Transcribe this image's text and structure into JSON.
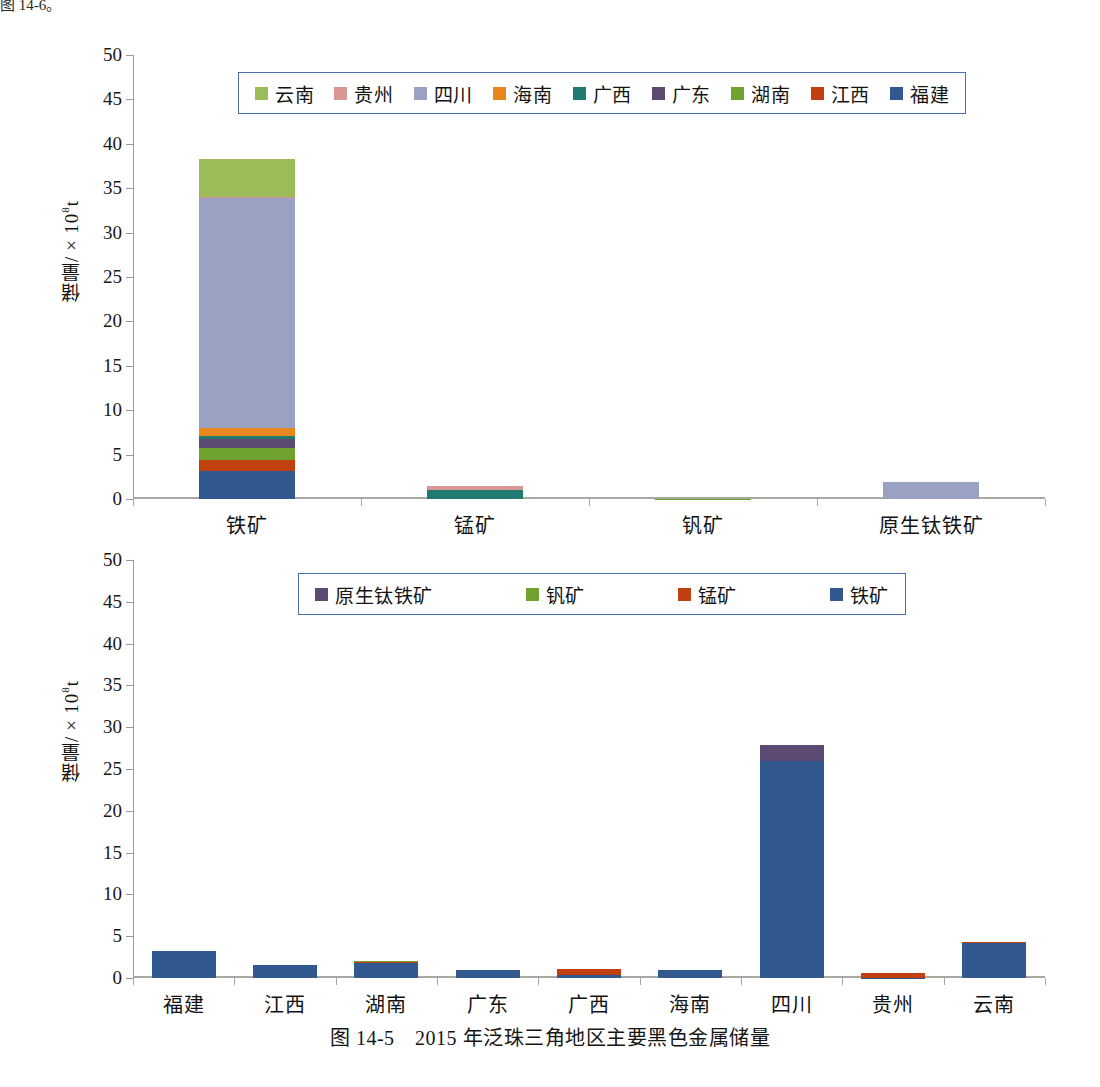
{
  "page": {
    "top_fragment": "图 14-6。",
    "caption": "图 14-5　2015 年泛珠三角地区主要黑色金属储量"
  },
  "colors": {
    "yunnan": "#9cbb59",
    "guizhou": "#d99694",
    "sichuan": "#9aa2c4",
    "hainan": "#e8871e",
    "guangxi": "#1f7a72",
    "guangdong": "#5c4a72",
    "hunan": "#6fa22e",
    "jiangxi": "#c0400f",
    "fujian": "#31588f",
    "tiekuang": "#31588f",
    "mengkuang": "#c0400f",
    "fankuang": "#6fa22e",
    "yuanshengtaitiekuang": "#5c4a72",
    "legend_border": "#4a6fb5",
    "axis": "#9a9a96"
  },
  "chart_data": [
    {
      "id": "chart-top",
      "type": "bar",
      "stacked": true,
      "title": "",
      "xlabel": "",
      "ylabel": "储量/×10⁸t",
      "ylim": [
        0,
        50
      ],
      "yticks": [
        0,
        5,
        10,
        15,
        20,
        25,
        30,
        35,
        40,
        45,
        50
      ],
      "grid": false,
      "legend_position": "top-center",
      "categories": [
        "铁矿",
        "锰矿",
        "钒矿",
        "原生钛铁矿"
      ],
      "series": [
        {
          "name": "福建",
          "color_key": "fujian",
          "values": [
            3.2,
            0.0,
            0.0,
            0.0
          ]
        },
        {
          "name": "江西",
          "color_key": "jiangxi",
          "values": [
            1.2,
            0.0,
            0.0,
            0.0
          ]
        },
        {
          "name": "湖南",
          "color_key": "hunan",
          "values": [
            1.4,
            0.0,
            0.05,
            0.0
          ]
        },
        {
          "name": "广东",
          "color_key": "guangdong",
          "values": [
            1.0,
            0.0,
            0.0,
            0.0
          ]
        },
        {
          "name": "广西",
          "color_key": "guangxi",
          "values": [
            0.35,
            1.0,
            0.0,
            0.0
          ]
        },
        {
          "name": "海南",
          "color_key": "hainan",
          "values": [
            0.85,
            0.0,
            0.0,
            0.0
          ]
        },
        {
          "name": "四川",
          "color_key": "sichuan",
          "values": [
            26.0,
            0.0,
            0.0,
            1.9
          ]
        },
        {
          "name": "贵州",
          "color_key": "guizhou",
          "values": [
            0.05,
            0.5,
            0.0,
            0.0
          ]
        },
        {
          "name": "云南",
          "color_key": "yunnan",
          "values": [
            4.2,
            0.0,
            0.0,
            0.0
          ]
        }
      ],
      "legend": [
        {
          "label": "云南",
          "color_key": "yunnan"
        },
        {
          "label": "贵州",
          "color_key": "guizhou"
        },
        {
          "label": "四川",
          "color_key": "sichuan"
        },
        {
          "label": "海南",
          "color_key": "hainan"
        },
        {
          "label": "广西",
          "color_key": "guangxi"
        },
        {
          "label": "广东",
          "color_key": "guangdong"
        },
        {
          "label": "湖南",
          "color_key": "hunan"
        },
        {
          "label": "江西",
          "color_key": "jiangxi"
        },
        {
          "label": "福建",
          "color_key": "fujian"
        }
      ]
    },
    {
      "id": "chart-bottom",
      "type": "bar",
      "stacked": true,
      "title": "",
      "xlabel": "",
      "ylabel": "储量/×10⁸t",
      "ylim": [
        0,
        50
      ],
      "yticks": [
        0,
        5,
        10,
        15,
        20,
        25,
        30,
        35,
        40,
        45,
        50
      ],
      "grid": false,
      "legend_position": "top-center",
      "categories": [
        "福建",
        "江西",
        "湖南",
        "广东",
        "广西",
        "海南",
        "四川",
        "贵州",
        "云南"
      ],
      "series": [
        {
          "name": "铁矿",
          "color_key": "tiekuang",
          "values": [
            3.2,
            1.5,
            1.85,
            1.0,
            0.35,
            0.9,
            26.0,
            0.05,
            4.15
          ]
        },
        {
          "name": "锰矿",
          "color_key": "mengkuang",
          "values": [
            0.0,
            0.0,
            0.18,
            0.0,
            0.78,
            0.0,
            0.0,
            0.5,
            0.18
          ]
        },
        {
          "name": "钒矿",
          "color_key": "fankuang",
          "values": [
            0.0,
            0.0,
            0.05,
            0.0,
            0.0,
            0.0,
            0.0,
            0.0,
            0.0
          ]
        },
        {
          "name": "原生钛铁矿",
          "color_key": "yuanshengtaitiekuang",
          "values": [
            0.0,
            0.0,
            0.0,
            0.0,
            0.0,
            0.0,
            1.9,
            0.0,
            0.0
          ]
        }
      ],
      "legend": [
        {
          "label": "原生钛铁矿",
          "color_key": "yuanshengtaitiekuang"
        },
        {
          "label": "钒矿",
          "color_key": "fankuang"
        },
        {
          "label": "锰矿",
          "color_key": "mengkuang"
        },
        {
          "label": "铁矿",
          "color_key": "tiekuang"
        }
      ]
    }
  ]
}
